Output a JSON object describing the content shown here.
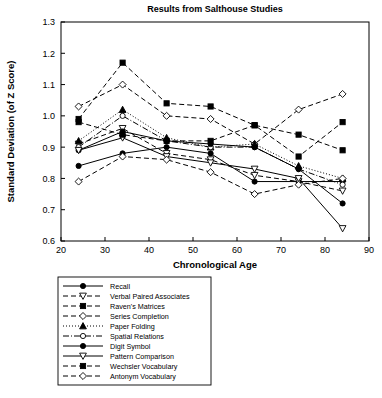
{
  "chart_data": {
    "type": "line",
    "title": "Results from Salthouse Studies",
    "xlabel": "Chronological Age",
    "ylabel": "Standard Deviation (of Z Score)",
    "xlim": [
      20,
      90
    ],
    "ylim": [
      0.6,
      1.3
    ],
    "xticks": [
      20,
      30,
      40,
      50,
      60,
      70,
      80,
      90
    ],
    "yticks": [
      0.6,
      0.7,
      0.8,
      0.9,
      1.0,
      1.1,
      1.2,
      1.3
    ],
    "xtick_labels": [
      "20",
      "30",
      "40",
      "50",
      "60",
      "70",
      "80",
      "90"
    ],
    "ytick_labels": [
      "0.6",
      "0.7",
      "0.8",
      "0.9",
      "1.0",
      "1.1",
      "1.2",
      "1.3"
    ],
    "grid": false,
    "legend_position": "below",
    "x": [
      24,
      34,
      44,
      54,
      64,
      74,
      84
    ],
    "series": [
      {
        "name": "Recall",
        "marker": "circle-filled",
        "line": "solid",
        "values": [
          0.84,
          0.88,
          0.9,
          0.88,
          0.79,
          0.79,
          0.79
        ]
      },
      {
        "name": "Verbal Paired Associates",
        "marker": "triangle-down-open",
        "line": "dashed",
        "values": [
          0.91,
          0.96,
          0.88,
          0.86,
          0.81,
          0.79,
          0.76
        ]
      },
      {
        "name": "Raven's Matrices",
        "marker": "square-filled",
        "line": "dashed",
        "values": [
          0.99,
          1.17,
          1.04,
          1.03,
          0.97,
          0.94,
          0.89
        ]
      },
      {
        "name": "Series Completion",
        "marker": "diamond-open",
        "line": "dashed",
        "values": [
          1.03,
          1.1,
          1.0,
          0.99,
          0.91,
          1.02,
          1.07
        ]
      },
      {
        "name": "Paper Folding",
        "marker": "triangle-up-filled",
        "line": "dotted",
        "values": [
          0.92,
          1.02,
          0.93,
          0.9,
          0.91,
          0.84,
          0.8
        ]
      },
      {
        "name": "Spatial Relations",
        "marker": "circle-open",
        "line": "dashdot",
        "values": [
          0.9,
          1.0,
          0.92,
          0.9,
          0.9,
          0.83,
          0.78
        ]
      },
      {
        "name": "Digit Symbol",
        "marker": "circle-filled",
        "line": "solid",
        "values": [
          0.89,
          0.95,
          0.92,
          0.91,
          0.9,
          0.83,
          0.72
        ]
      },
      {
        "name": "Pattern Comparison",
        "marker": "triangle-down-open",
        "line": "solid",
        "values": [
          0.89,
          0.93,
          0.87,
          0.85,
          0.83,
          0.8,
          0.64
        ]
      },
      {
        "name": "Wechsler Vocabulary",
        "marker": "square-filled",
        "line": "dashed",
        "values": [
          0.98,
          0.94,
          0.92,
          0.92,
          0.97,
          0.87,
          0.98
        ]
      },
      {
        "name": "Antonym Vocabulary",
        "marker": "diamond-open",
        "line": "dashed",
        "values": [
          0.79,
          0.87,
          0.86,
          0.82,
          0.75,
          0.78,
          0.8
        ]
      }
    ]
  },
  "legend": {
    "items": [
      {
        "label": "Recall"
      },
      {
        "label": "Verbal Paired Associates"
      },
      {
        "label": "Raven's Matrices"
      },
      {
        "label": "Series Completion"
      },
      {
        "label": "Paper Folding"
      },
      {
        "label": "Spatial Relations"
      },
      {
        "label": "Digit Symbol"
      },
      {
        "label": "Pattern Comparison"
      },
      {
        "label": "Wechsler Vocabulary"
      },
      {
        "label": "Antonym Vocabulary"
      }
    ]
  },
  "colors": {
    "ink": "#000000",
    "background": "#ffffff"
  }
}
